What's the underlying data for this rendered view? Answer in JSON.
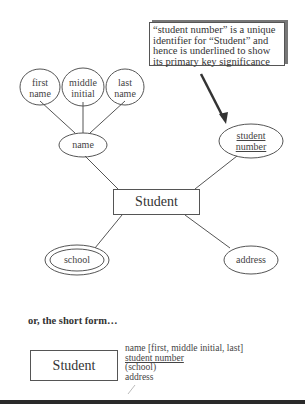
{
  "note": {
    "text": "“student number” is a unique identifier for “Student” and hence is underlined to show its primary key significance"
  },
  "diagram": {
    "entity": "Student",
    "attributes": {
      "first_name": [
        "first",
        "name"
      ],
      "middle_initial": [
        "middle",
        "initial"
      ],
      "last_name": [
        "last",
        "name"
      ],
      "name": "name",
      "student_number": [
        "student",
        "number"
      ],
      "school": "school",
      "address": "address"
    }
  },
  "short_form": {
    "heading": "or, the short form…",
    "entity": "Student",
    "attributes": [
      "name [first, middle initial, last]",
      "student number",
      "(school)",
      "address"
    ]
  }
}
